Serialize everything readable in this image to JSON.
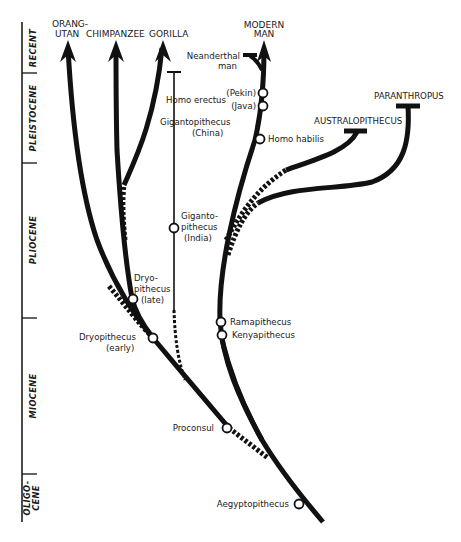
{
  "timescale": {
    "eras": [
      {
        "label": "RECENT"
      },
      {
        "label": "PLEISTOCENE"
      },
      {
        "label": "PLIOCENE"
      },
      {
        "label": "MIOCENE"
      },
      {
        "label": "OLIGO-",
        "label2": "CENE"
      }
    ]
  },
  "living": {
    "orangutan": {
      "line1": "ORANG-",
      "line2": "UTAN"
    },
    "chimpanzee": "CHIMPANZEE",
    "gorilla": "GORILLA",
    "modern_man": {
      "line1": "MODERN",
      "line2": "MAN"
    }
  },
  "extinct": {
    "neanderthal": {
      "line1": "Neanderthal",
      "line2": "man"
    },
    "australopithecus": "AUSTRALOPITHECUS",
    "paranthropus": "PARANTHROPUS"
  },
  "fossils": {
    "homo_erectus": "Homo erectus",
    "pekin": "(Pekin)",
    "java": "(Java)",
    "homo_habilis": "Homo habilis",
    "giganto_china": {
      "line1": "Gigantopithecus",
      "line2": "(China)"
    },
    "giganto_india": {
      "line1": "Giganto-",
      "line2": "pithecus",
      "line3": "(India)"
    },
    "dryo_late": {
      "line1": "Dryo-",
      "line2": "pithecus",
      "line3": "(late)"
    },
    "dryo_early": {
      "line1": "Dryopithecus",
      "line2": "(early)"
    },
    "ramapithecus": "Ramapithecus",
    "kenyapithecus": "Kenyapithecus",
    "proconsul": "Proconsul",
    "aegyptopithecus": "Aegyptopithecus"
  }
}
